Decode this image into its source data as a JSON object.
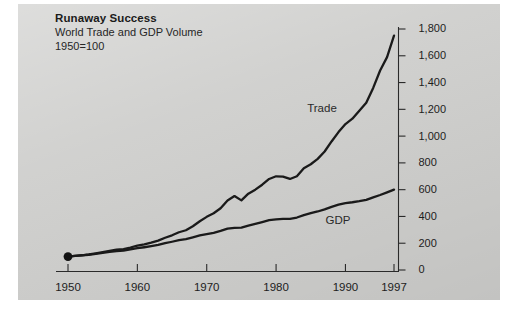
{
  "panel": {
    "background_color": "#cfcfcd"
  },
  "title": {
    "headline": "Runaway Success",
    "subtitle": "World Trade and GDP Volume",
    "base_note": "1950=100"
  },
  "series_labels": {
    "trade": "Trade",
    "gdp": "GDP"
  },
  "axes": {
    "y_ticks": [
      "0",
      "200",
      "400",
      "600",
      "800",
      "1,000",
      "1,200",
      "1,400",
      "1,600",
      "1,800"
    ],
    "x_ticks": [
      "1950",
      "1960",
      "1970",
      "1980",
      "1990",
      "1997"
    ]
  },
  "chart_data": {
    "type": "line",
    "title": "Runaway Success",
    "subtitle": "World Trade and GDP Volume",
    "annotation": "1950=100",
    "xlabel": "",
    "ylabel": "",
    "index_base": "1950=100",
    "xlim": [
      1950,
      1997
    ],
    "ylim": [
      0,
      1800
    ],
    "y_tick_values": [
      0,
      200,
      400,
      600,
      800,
      1000,
      1200,
      1400,
      1600,
      1800
    ],
    "x_tick_values": [
      1950,
      1960,
      1970,
      1980,
      1990,
      1997
    ],
    "grid": false,
    "legend_position": "inline-labels",
    "markers": [
      {
        "x": 1950,
        "y": 100,
        "style": "filled-circle"
      }
    ],
    "x": [
      1950,
      1951,
      1952,
      1953,
      1954,
      1955,
      1956,
      1957,
      1958,
      1959,
      1960,
      1961,
      1962,
      1963,
      1964,
      1965,
      1966,
      1967,
      1968,
      1969,
      1970,
      1971,
      1972,
      1973,
      1974,
      1975,
      1976,
      1977,
      1978,
      1979,
      1980,
      1981,
      1982,
      1983,
      1984,
      1985,
      1986,
      1987,
      1988,
      1989,
      1990,
      1991,
      1992,
      1993,
      1994,
      1995,
      1996,
      1997
    ],
    "series": [
      {
        "name": "Trade",
        "label": "Trade",
        "color": "#1a1a1a",
        "values": [
          100,
          106,
          110,
          116,
          124,
          133,
          143,
          152,
          156,
          168,
          182,
          192,
          204,
          219,
          241,
          259,
          282,
          297,
          327,
          364,
          397,
          424,
          461,
          519,
          552,
          520,
          570,
          600,
          637,
          680,
          700,
          698,
          680,
          700,
          760,
          790,
          830,
          885,
          960,
          1030,
          1090,
          1130,
          1190,
          1250,
          1360,
          1490,
          1590,
          1750
        ]
      },
      {
        "name": "GDP",
        "label": "GDP",
        "color": "#1a1a1a",
        "values": [
          100,
          105,
          109,
          114,
          121,
          128,
          135,
          141,
          145,
          154,
          163,
          170,
          178,
          187,
          200,
          211,
          223,
          231,
          244,
          258,
          268,
          278,
          292,
          309,
          315,
          317,
          332,
          345,
          358,
          372,
          378,
          382,
          382,
          392,
          410,
          424,
          437,
          453,
          472,
          488,
          500,
          506,
          514,
          524,
          543,
          560,
          580,
          600
        ]
      }
    ]
  }
}
